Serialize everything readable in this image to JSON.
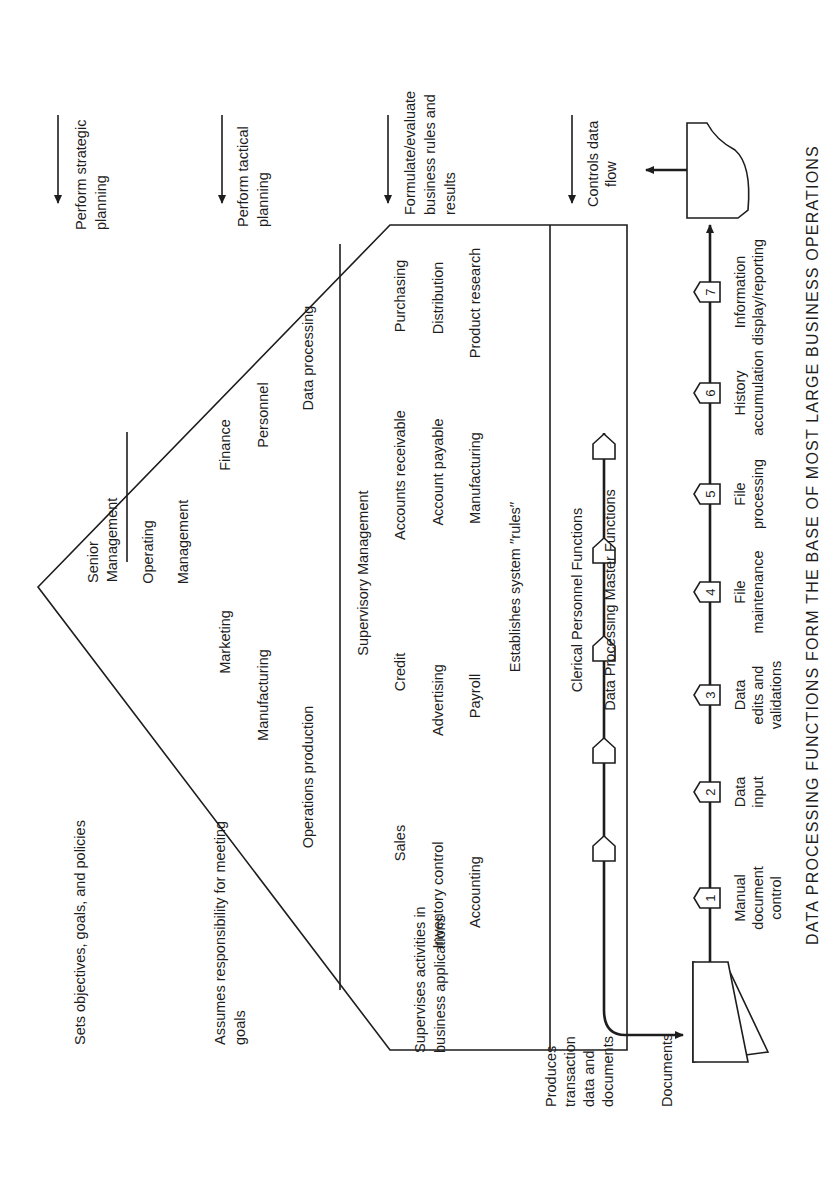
{
  "figure": {
    "orientation": "rotated 90 degrees counter-clockwise",
    "caption": "DATA PROCESSING FUNCTIONS FORM THE BASE OF MOST LARGE BUSINESS OPERATIONS",
    "pyramid": {
      "senior": {
        "title_line1": "Senior",
        "title_line2": "Management"
      },
      "operating": {
        "title_line1": "Operating",
        "title_line2": "Management",
        "items": [
          "Marketing",
          "Finance",
          "Manufacturing",
          "Personnel",
          "Operations production",
          "Data processing"
        ]
      },
      "supervisory": {
        "title": "Supervisory Management",
        "items": [
          "Sales",
          "Credit",
          "Accounts receivable",
          "Purchasing",
          "Inventory control",
          "Advertising",
          "Account payable",
          "Distribution",
          "Accounting",
          "Payroll",
          "Manufacturing",
          "Product research"
        ],
        "rules_note": "Establishes system ′′rules′′"
      },
      "clerical": {
        "title": "Clerical Personnel Functions"
      },
      "dp_master": {
        "title": "Data Processing Master Functions"
      }
    },
    "left_descriptions": {
      "senior": "Sets objectives, goals, and policies",
      "operating_line1": "Assumes responsibility for meeting",
      "operating_line2": "goals",
      "supervisory_line1": "Supervises activities in",
      "supervisory_line2": "business applications",
      "clerical_line1": "Produces",
      "clerical_line2": "transaction",
      "clerical_line3": "data and",
      "clerical_line4": "documents",
      "documents": "Documents"
    },
    "right_descriptions": {
      "strategic_line1": "Perform strategic",
      "strategic_line2": "planning",
      "tactical_line1": "Perform tactical",
      "tactical_line2": "planning",
      "rules_line1": "Formulate/evaluate",
      "rules_line2": "business rules and",
      "rules_line3": "results",
      "control_line1": "Controls data",
      "control_line2": "flow"
    },
    "process_steps": [
      {
        "num": "1",
        "line1": "Manual",
        "line2": "document",
        "line3": "control"
      },
      {
        "num": "2",
        "line1": "Data",
        "line2": "input",
        "line3": ""
      },
      {
        "num": "3",
        "line1": "Data",
        "line2": "edits and",
        "line3": "validations"
      },
      {
        "num": "4",
        "line1": "File",
        "line2": "maintenance",
        "line3": ""
      },
      {
        "num": "5",
        "line1": "File",
        "line2": "processing",
        "line3": ""
      },
      {
        "num": "6",
        "line1": "History",
        "line2": "accumulation",
        "line3": ""
      },
      {
        "num": "7",
        "line1": "Information",
        "line2": "display/reporting",
        "line3": ""
      }
    ]
  }
}
